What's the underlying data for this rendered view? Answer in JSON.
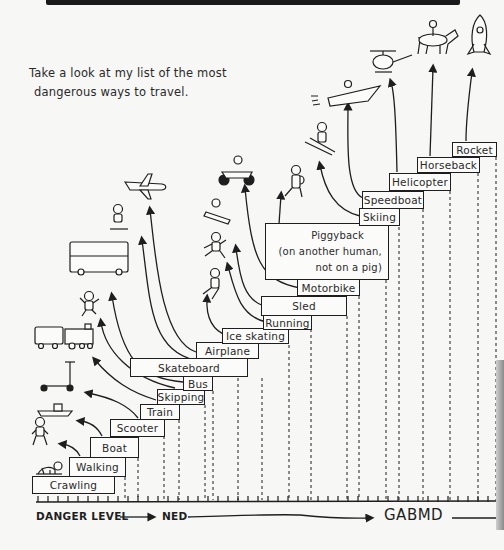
{
  "intro": {
    "line1": "Take a look at my list of the most",
    "line2": "dangerous ways to travel."
  },
  "axis": {
    "label": "DANGER LEVEL",
    "low": "NED",
    "high": "GABMD"
  },
  "steps": [
    {
      "rank": 1,
      "label": "Crawling",
      "icon": "crawling-baby-icon"
    },
    {
      "rank": 2,
      "label": "Walking",
      "icon": "walking-person-icon"
    },
    {
      "rank": 3,
      "label": "Boat",
      "icon": "boat-icon"
    },
    {
      "rank": 4,
      "label": "Scooter",
      "icon": "kick-scooter-icon"
    },
    {
      "rank": 5,
      "label": "Train",
      "icon": "train-icon"
    },
    {
      "rank": 6,
      "label": "Skipping",
      "icon": "skipping-person-icon"
    },
    {
      "rank": 7,
      "label": "Bus",
      "icon": "double-decker-bus-icon"
    },
    {
      "rank": 8,
      "label": "Skateboard",
      "icon": "skateboarder-icon"
    },
    {
      "rank": 9,
      "label": "Airplane",
      "icon": "airplane-icon"
    },
    {
      "rank": 10,
      "label": "Ice skating",
      "icon": "ice-skater-icon"
    },
    {
      "rank": 11,
      "label": "Running",
      "icon": "running-person-icon"
    },
    {
      "rank": 12,
      "label": "Sled",
      "icon": "sled-icon"
    },
    {
      "rank": 13,
      "label": "Motorbike",
      "icon": "motorbike-icon"
    },
    {
      "rank": 14,
      "label": "Piggyback",
      "label_line2": "(on another human,",
      "label_line3": "not on a pig)",
      "icon": "piggyback-icon"
    },
    {
      "rank": 15,
      "label": "Skiing",
      "icon": "skier-icon"
    },
    {
      "rank": 16,
      "label": "Speedboat",
      "icon": "speedboat-icon"
    },
    {
      "rank": 17,
      "label": "Helicopter",
      "icon": "helicopter-icon"
    },
    {
      "rank": 18,
      "label": "Horseback",
      "icon": "horse-rider-icon"
    },
    {
      "rank": 19,
      "label": "Rocket",
      "icon": "rocket-icon"
    }
  ],
  "colors": {
    "ink": "#1e1e1e",
    "paper": "#f7f7f5"
  }
}
